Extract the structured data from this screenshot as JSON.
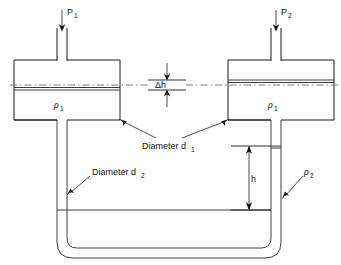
{
  "figure": {
    "kind": "differential-manometer-diagram",
    "title": "",
    "background_color": "#ffffff",
    "line_color": "#1a1a1a",
    "dash_color": "#6f6f6f",
    "fluid_line_color": "#3a3a3a"
  },
  "labels": {
    "pressure_left": "P",
    "pressure_left_sub": "1",
    "pressure_right": "P",
    "pressure_right_sub": "2",
    "delta_h": "Δh",
    "h": "h",
    "diameter_d1": "Diameter d",
    "diameter_d1_sub": "1",
    "diameter_d2": "Diameter d",
    "diameter_d2_sub": "2",
    "rho_left": "ρ",
    "rho_left_sub": "1",
    "rho_right": "ρ",
    "rho_right_sub": "1",
    "rho_bottom": "ρ",
    "rho_bottom_sub": "2"
  },
  "icons": {
    "inlet_arrow_left": "down-arrow-icon",
    "inlet_arrow_right": "down-arrow-icon",
    "delta_h_arrow_top": "up-arrow-icon",
    "delta_h_arrow_bottom": "down-arrow-icon",
    "h_arrow_top": "up-arrow-icon",
    "h_arrow_bottom": "down-arrow-icon",
    "leader_arrow_d1_left": "leader-arrow-icon",
    "leader_arrow_d1_right": "leader-arrow-icon",
    "leader_arrow_d2": "leader-arrow-icon",
    "leader_arrow_rho2": "leader-arrow-icon"
  },
  "geometry": {
    "left_chamber": {
      "x": 14,
      "y": 60,
      "w": 106,
      "h": 60
    },
    "right_chamber": {
      "x": 228,
      "y": 60,
      "w": 106,
      "h": 60
    },
    "centerline_y": 85,
    "left_fluid_y": 90,
    "right_fluid_y": 80,
    "left_tube_x": 62,
    "right_tube_x": 276,
    "bottom_fluid_y": 210,
    "right_fluid_top_y": 146
  }
}
